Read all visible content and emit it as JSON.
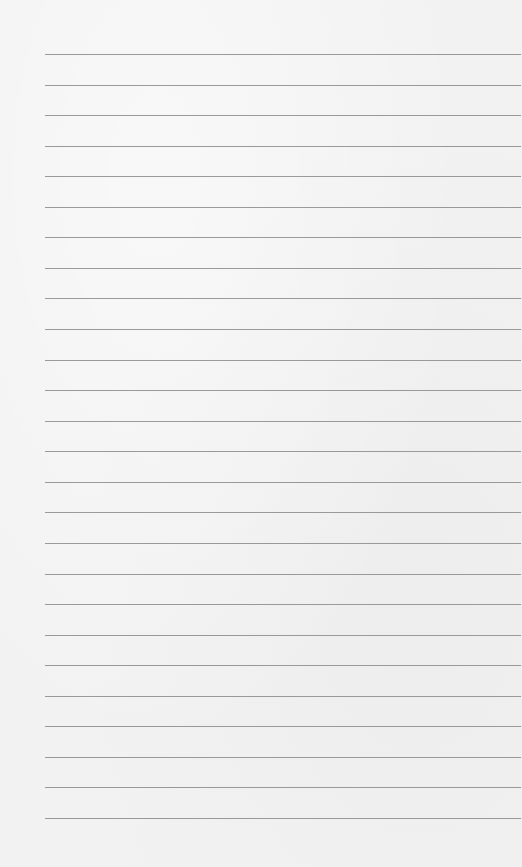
{
  "paper": {
    "type": "lined-paper",
    "background_color": "#f2f2f2",
    "line_color": "#8a8a8a",
    "line_count": 26,
    "first_line_y": 54,
    "line_spacing": 30.56,
    "line_left": 45,
    "line_right": 521
  }
}
